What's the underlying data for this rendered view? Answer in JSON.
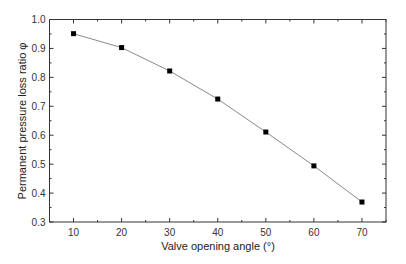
{
  "chart_data": {
    "type": "line",
    "title": "",
    "xlabel": "Valve opening angle (°)",
    "ylabel": "Permanent pressure loss ratio φ",
    "x": [
      10,
      20,
      30,
      40,
      50,
      60,
      70
    ],
    "series": [
      {
        "name": "Permanent pressure loss ratio",
        "values": [
          0.951,
          0.903,
          0.822,
          0.725,
          0.611,
          0.494,
          0.369
        ],
        "marker": "square",
        "line_color": "#8a8a8a",
        "marker_color": "#000000"
      }
    ],
    "xlim": [
      5,
      75
    ],
    "ylim": [
      0.3,
      1.0
    ],
    "xticks": [
      10,
      20,
      30,
      40,
      50,
      60,
      70
    ],
    "yticks": [
      0.3,
      0.4,
      0.5,
      0.6,
      0.7,
      0.8,
      0.9,
      1.0
    ],
    "xtick_labels": [
      "10",
      "20",
      "30",
      "40",
      "50",
      "60",
      "70"
    ],
    "ytick_labels": [
      "0.3",
      "0.4",
      "0.5",
      "0.6",
      "0.7",
      "0.8",
      "0.9",
      "1.0"
    ],
    "grid": false,
    "legend": null
  }
}
